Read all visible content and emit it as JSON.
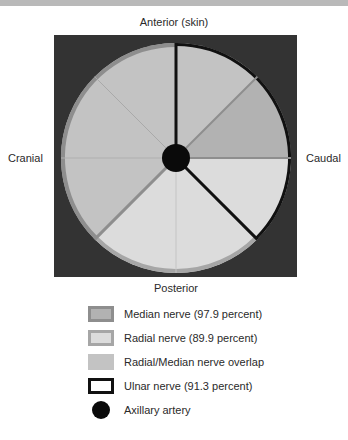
{
  "orientation": {
    "top": "Anterior (skin)",
    "bottom": "Posterior",
    "left": "Cranial",
    "right": "Caudal"
  },
  "colors": {
    "background_square": "#333333",
    "median": "#b2b2b2",
    "median_border": "#8e8e8e",
    "radial": "#dcdcdc",
    "radial_border": "#a6a6a6",
    "overlap": "#c3c3c3",
    "ulnar_border": "#111111",
    "artery": "#0a0a0a"
  },
  "diagram": {
    "segments_degrees_from_top_clockwise": [
      {
        "start": 0,
        "end": 45,
        "fill": "overlap"
      },
      {
        "start": 45,
        "end": 90,
        "fill": "median"
      },
      {
        "start": 90,
        "end": 135,
        "fill": "radial"
      },
      {
        "start": 135,
        "end": 180,
        "fill": "radial"
      },
      {
        "start": 180,
        "end": 225,
        "fill": "radial"
      },
      {
        "start": 225,
        "end": 270,
        "fill": "overlap"
      },
      {
        "start": 270,
        "end": 315,
        "fill": "overlap"
      },
      {
        "start": 315,
        "end": 360,
        "fill": "overlap"
      }
    ],
    "ulnar_region": {
      "start": 0,
      "end": 135
    },
    "center_marker": "axillary-artery"
  },
  "legend": {
    "items": [
      {
        "key": "median",
        "label": "Median nerve (97.9 percent)"
      },
      {
        "key": "radial",
        "label": "Radial nerve (89.9 percent)"
      },
      {
        "key": "overlap",
        "label": "Radial/Median nerve overlap"
      },
      {
        "key": "ulnar",
        "label": "Ulnar nerve (91.3 percent)"
      },
      {
        "key": "artery",
        "label": "Axillary artery"
      }
    ]
  }
}
